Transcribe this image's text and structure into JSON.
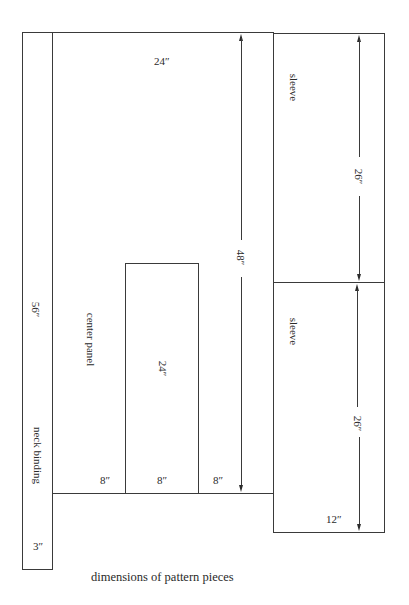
{
  "diagram": {
    "title": "dimensions of pattern pieces",
    "pieces": {
      "neck_binding": {
        "label": "neck binding",
        "length": "56″",
        "width": "3″"
      },
      "center_panel": {
        "label": "center panel",
        "top_width": "24″",
        "height": "48″",
        "bottom_segments": [
          "8″",
          "8″",
          "8″"
        ],
        "neck_opening_height": "24″"
      },
      "sleeve_top": {
        "label": "sleeve",
        "length": "26″"
      },
      "sleeve_bottom": {
        "label": "sleeve",
        "length": "26″",
        "width": "12″"
      }
    }
  }
}
